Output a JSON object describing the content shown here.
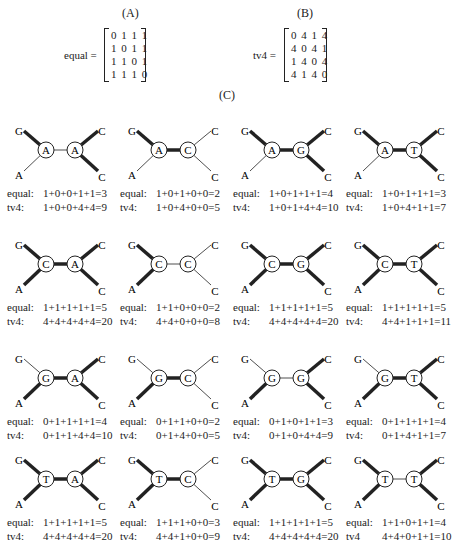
{
  "panels": {
    "a_label": "(A)",
    "b_label": "(B)",
    "c_label": "(C)"
  },
  "matrix_equal": {
    "name": "equal =",
    "rows": [
      "0 1 1 1",
      "1 0 1 1",
      "1 1 0 1",
      "1 1 1 0"
    ]
  },
  "matrix_tv4": {
    "name": "tv4 =",
    "rows": [
      "0 4 1 4",
      "4 0 4 1",
      "1 4 0 4",
      "4 1 4 0"
    ]
  },
  "leaves": {
    "top_left": "G",
    "bottom_left": "A",
    "top_right": "C",
    "bottom_right": "C"
  },
  "trees": [
    {
      "left": "A",
      "right": "A",
      "thick": [
        1,
        0,
        0,
        1,
        1
      ],
      "equal_label": "equal:",
      "equal": "1+0+0+1+1=3",
      "tv4_label": "tv4:",
      "tv4": "1+0+0+4+4=9"
    },
    {
      "left": "A",
      "right": "C",
      "thick": [
        1,
        0,
        1,
        0,
        0
      ],
      "equal_label": "equal:",
      "equal": "1+0+1+0+0=2",
      "tv4_label": "tv4:",
      "tv4": "1+0+4+0+0=5"
    },
    {
      "left": "A",
      "right": "G",
      "thick": [
        1,
        0,
        1,
        1,
        1
      ],
      "equal_label": "equal:",
      "equal": "1+0+1+1+1=4",
      "tv4_label": "tv4:",
      "tv4": "1+0+1+4+4=10"
    },
    {
      "left": "A",
      "right": "T",
      "thick": [
        1,
        0,
        1,
        1,
        1
      ],
      "equal_label": "equal:",
      "equal": "1+0+1+1+1=3",
      "tv4_label": "tv4:",
      "tv4": "1+0+4+1+1=7"
    },
    {
      "left": "C",
      "right": "A",
      "thick": [
        1,
        1,
        1,
        1,
        1
      ],
      "equal_label": "equal:",
      "equal": "1+1+1+1+1=5",
      "tv4_label": "tv4:",
      "tv4": "4+4+4+4+4=20"
    },
    {
      "left": "C",
      "right": "C",
      "thick": [
        1,
        1,
        0,
        0,
        0
      ],
      "equal_label": "equal:",
      "equal": "1+1+0+0+0=2",
      "tv4_label": "tv4:",
      "tv4": "4+4+0+0+0=8"
    },
    {
      "left": "C",
      "right": "G",
      "thick": [
        1,
        1,
        1,
        1,
        1
      ],
      "equal_label": "equal:",
      "equal": "1+1+1+1+1=5",
      "tv4_label": "tv4:",
      "tv4": "4+4+4+4+4=20"
    },
    {
      "left": "C",
      "right": "T",
      "thick": [
        1,
        1,
        1,
        1,
        1
      ],
      "equal_label": "equal:",
      "equal": "1+1+1+1+1=5",
      "tv4_label": "tv4:",
      "tv4": "4+4+1+1+1=11"
    },
    {
      "left": "G",
      "right": "A",
      "thick": [
        0,
        1,
        1,
        1,
        1
      ],
      "equal_label": "equal:",
      "equal": "0+1+1+1+1=4",
      "tv4_label": "tv4:",
      "tv4": "0+1+1+4+4=10"
    },
    {
      "left": "G",
      "right": "C",
      "thick": [
        0,
        1,
        1,
        0,
        0
      ],
      "equal_label": "equal:",
      "equal": "0+1+1+0+0=2",
      "tv4_label": "tv4:",
      "tv4": "0+1+4+0+0=5"
    },
    {
      "left": "G",
      "right": "G",
      "thick": [
        0,
        1,
        0,
        1,
        1
      ],
      "equal_label": "equal:",
      "equal": "0+1+0+1+1=3",
      "tv4_label": "tv4:",
      "tv4": "0+1+0+4+4=9"
    },
    {
      "left": "G",
      "right": "T",
      "thick": [
        0,
        1,
        1,
        1,
        1
      ],
      "equal_label": "equal:",
      "equal": "0+1+1+1+1=4",
      "tv4_label": "tv4:",
      "tv4": "0+1+4+1+1=7"
    },
    {
      "left": "T",
      "right": "A",
      "thick": [
        1,
        1,
        1,
        1,
        1
      ],
      "equal_label": "equal:",
      "equal": "1+1+1+1+1=5",
      "tv4_label": "tv4:",
      "tv4": "4+4+4+4+4=20"
    },
    {
      "left": "T",
      "right": "C",
      "thick": [
        1,
        1,
        1,
        0,
        0
      ],
      "equal_label": "equal:",
      "equal": "1+1+1+0+0=3",
      "tv4_label": "tv4:",
      "tv4": "4+4+1+0+0=9"
    },
    {
      "left": "T",
      "right": "G",
      "thick": [
        1,
        1,
        1,
        1,
        1
      ],
      "equal_label": "equal:",
      "equal": "1+1+1+1+1=5",
      "tv4_label": "tv4:",
      "tv4": "4+4+4+4+4=20"
    },
    {
      "left": "T",
      "right": "T",
      "thick": [
        1,
        1,
        0,
        1,
        1
      ],
      "equal_label": "equal:",
      "equal": "1+1+0+1+1=4",
      "tv4_label": "tv4",
      "tv4": "4+4+0+1+1=10"
    }
  ]
}
